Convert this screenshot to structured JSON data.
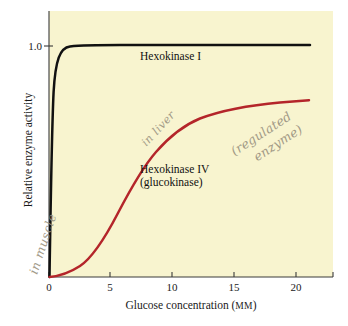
{
  "figure": {
    "background_color": "#ffffff",
    "plot_background_color": "#f8f4cf",
    "axis_color": "#3a3a3a"
  },
  "chart_data": {
    "type": "line",
    "title": "",
    "xlabel": "Glucose concentration (mM)",
    "ylabel": "Relative enzyme activity",
    "xlim": [
      0,
      23
    ],
    "ylim": [
      0,
      1.12
    ],
    "xticks": [
      0,
      5,
      10,
      15,
      20
    ],
    "xticklabels": [
      "0",
      "5",
      "10",
      "15",
      "20"
    ],
    "yticks": [
      1.0
    ],
    "yticklabels": [
      "1.0"
    ],
    "grid": false,
    "legend": "inline-labels",
    "series": [
      {
        "name": "Hexokinase I",
        "color": "#111111",
        "label_line1": "Hexokinase I",
        "label_line2": "",
        "note": "hyperbolic, very low Km (~0.05 mM), saturates near 1.0",
        "x": [
          0,
          0.05,
          0.1,
          0.2,
          0.3,
          0.5,
          0.75,
          1.0,
          1.5,
          2.0,
          2.5,
          3.0,
          4.0,
          5.0,
          7.5,
          10,
          12.5,
          15,
          17.5,
          20,
          22.5
        ],
        "y": [
          0,
          0.48,
          0.66,
          0.8,
          0.86,
          0.91,
          0.94,
          0.955,
          0.97,
          0.98,
          0.985,
          0.99,
          0.995,
          0.997,
          0.999,
          1.0,
          1.0,
          1.0,
          1.0,
          1.0,
          1.0
        ]
      },
      {
        "name": "Hexokinase IV (glucokinase)",
        "color": "#b4252a",
        "label_line1": "Hexokinase IV",
        "label_line2": "(glucokinase)",
        "note": "sigmoidal, high S0.5 (~10 mM), does not saturate in range",
        "x": [
          0,
          1,
          2,
          3,
          4,
          5,
          6,
          7,
          8,
          9,
          10,
          11,
          12,
          13,
          14,
          15,
          16,
          17,
          18,
          19,
          20,
          21,
          22,
          22.5
        ],
        "y": [
          0,
          0.012,
          0.03,
          0.055,
          0.095,
          0.145,
          0.205,
          0.275,
          0.345,
          0.415,
          0.475,
          0.525,
          0.562,
          0.59,
          0.612,
          0.63,
          0.645,
          0.658,
          0.668,
          0.678,
          0.687,
          0.695,
          0.702,
          0.705
        ]
      }
    ],
    "annotations": [
      {
        "id": "in-muscle",
        "text": "in muscle",
        "style": "handwritten-pencil",
        "rotation": -72,
        "near": "Hexokinase I"
      },
      {
        "id": "in-liver",
        "text": "in liver",
        "style": "handwritten-pencil",
        "rotation": -47,
        "near": "Hexokinase IV"
      },
      {
        "id": "regulated-enzyme",
        "text_line1": "(regulated",
        "text_line2": "enzyme)",
        "style": "handwritten-pencil",
        "rotation": -33,
        "near": "Hexokinase IV"
      }
    ]
  }
}
